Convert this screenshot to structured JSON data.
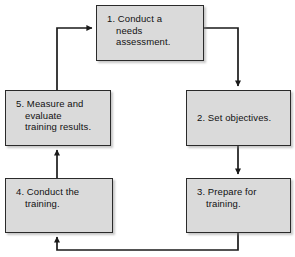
{
  "diagram": {
    "orientation": "clockwise-loop",
    "colors": {
      "node_fill": "#dadada",
      "node_border": "#2a2a2a",
      "connector": "#1a1a1a",
      "text": "#111111",
      "canvas": "#ffffff"
    },
    "nodes": [
      {
        "id": "box-1",
        "number": "1.",
        "label": "1. Conduct a\nneeds\nassessment.",
        "text_only": "Conduct a needs assessment."
      },
      {
        "id": "box-2",
        "number": "2.",
        "label": "2. Set objectives.",
        "text_only": "Set objectives."
      },
      {
        "id": "box-3",
        "number": "3.",
        "label": "3. Prepare for\ntraining.",
        "text_only": "Prepare for training."
      },
      {
        "id": "box-4",
        "number": "4.",
        "label": "4. Conduct the\ntraining.",
        "text_only": "Conduct the training."
      },
      {
        "id": "box-5",
        "number": "5.",
        "label": "5. Measure and\nevaluate\ntraining results.",
        "text_only": "Measure and evaluate training results."
      }
    ],
    "connectors": [
      {
        "id": "edge-1-to-2",
        "from": "box-1",
        "to": "box-2",
        "label": ""
      },
      {
        "id": "edge-2-to-3",
        "from": "box-2",
        "to": "box-3",
        "label": ""
      },
      {
        "id": "edge-3-to-4",
        "from": "box-3",
        "to": "box-4",
        "label": ""
      },
      {
        "id": "edge-4-to-5",
        "from": "box-4",
        "to": "box-5",
        "label": ""
      },
      {
        "id": "edge-5-to-1",
        "from": "box-5",
        "to": "box-1",
        "label": ""
      }
    ]
  }
}
